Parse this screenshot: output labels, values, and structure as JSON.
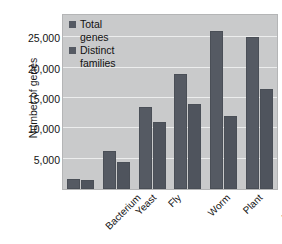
{
  "chart_data": {
    "type": "bar",
    "title": "",
    "xlabel": "",
    "ylabel": "Number of genes",
    "categories": [
      "Bacterium",
      "Yeast",
      "Fly",
      "Worm",
      "Plant",
      "Human"
    ],
    "series": [
      {
        "name": "Total genes",
        "values": [
          1700,
          6200,
          13500,
          19000,
          26000,
          25000
        ]
      },
      {
        "name": "Distinct families",
        "values": [
          1500,
          4400,
          11000,
          14000,
          12000,
          16500
        ]
      }
    ],
    "ylim": [
      0,
      29000
    ],
    "yticks": [
      5000,
      10000,
      15000,
      20000,
      25000
    ],
    "ytick_labels": [
      "5,000",
      "10,000",
      "15,000",
      "20,000",
      "25,000"
    ],
    "grid": true,
    "legend_position": "top-left-inside",
    "colors": {
      "bar_total": "#555a63",
      "bar_distinct": "#4f545d",
      "plot_background": "#c9cacb",
      "gridline": "#eceded",
      "page_background": "#ffffff",
      "text": "#141414"
    }
  },
  "legend": {
    "entries": [
      {
        "label": "Total\ngenes",
        "swatch_name": "legend-swatch-total-genes"
      },
      {
        "label": "Distinct\nfamilies",
        "swatch_name": "legend-swatch-distinct-families"
      }
    ]
  }
}
